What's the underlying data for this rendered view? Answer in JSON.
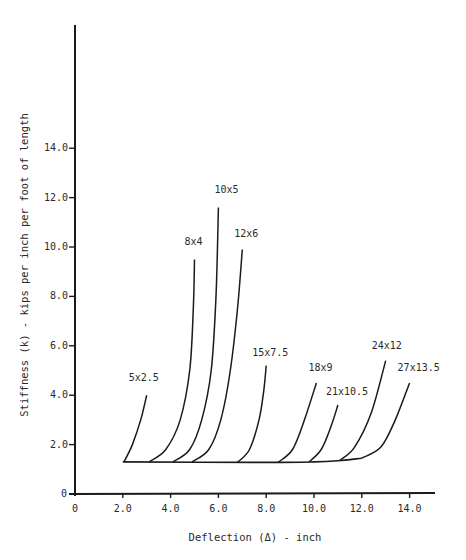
{
  "chart_data": {
    "type": "line",
    "title": "",
    "xlabel": "Deflection (Δ) - inch",
    "ylabel": "Stiffness (k) - kips per inch per foot of length",
    "xlim": [
      0,
      15
    ],
    "ylim": [
      0,
      17.5
    ],
    "x_ticks": [
      "0",
      "2.0",
      "4.0",
      "6.0",
      "8.0",
      "10.0",
      "12.0",
      "14.0"
    ],
    "x_tick_values": [
      0,
      2,
      4,
      6,
      8,
      10,
      12,
      14
    ],
    "y_ticks": [
      "0",
      "2.0",
      "4.0",
      "6.0",
      "8.0",
      "10.0",
      "12.0",
      "14.0"
    ],
    "y_tick_values": [
      0,
      2,
      4,
      6,
      8,
      10,
      12,
      14
    ],
    "grid": false,
    "legend": "inline labels at curve ends",
    "baseline": {
      "description": "common initial stiffness line",
      "points": [
        [
          2.0,
          1.3
        ],
        [
          8.0,
          1.28
        ],
        [
          10.0,
          1.3
        ],
        [
          11.0,
          1.35
        ],
        [
          12.0,
          1.45
        ]
      ]
    },
    "series": [
      {
        "name": "5x2.5",
        "points": [
          [
            2.05,
            1.3
          ],
          [
            2.4,
            2.0
          ],
          [
            2.75,
            3.0
          ],
          [
            3.0,
            4.0
          ]
        ]
      },
      {
        "name": "8x4",
        "points": [
          [
            3.1,
            1.3
          ],
          [
            3.8,
            1.8
          ],
          [
            4.4,
            3.0
          ],
          [
            4.8,
            5.0
          ],
          [
            4.95,
            7.5
          ],
          [
            5.0,
            9.5
          ]
        ]
      },
      {
        "name": "10x5",
        "points": [
          [
            4.1,
            1.3
          ],
          [
            4.8,
            1.8
          ],
          [
            5.3,
            3.0
          ],
          [
            5.7,
            5.0
          ],
          [
            5.9,
            8.0
          ],
          [
            6.0,
            11.6
          ]
        ]
      },
      {
        "name": "12x6",
        "points": [
          [
            4.9,
            1.3
          ],
          [
            5.6,
            1.8
          ],
          [
            6.1,
            3.0
          ],
          [
            6.5,
            5.0
          ],
          [
            6.8,
            7.5
          ],
          [
            7.0,
            9.9
          ]
        ]
      },
      {
        "name": "15x7.5",
        "points": [
          [
            6.8,
            1.28
          ],
          [
            7.3,
            1.8
          ],
          [
            7.7,
            3.0
          ],
          [
            7.9,
            4.2
          ],
          [
            8.0,
            5.2
          ]
        ]
      },
      {
        "name": "18x9",
        "points": [
          [
            8.5,
            1.28
          ],
          [
            9.1,
            1.8
          ],
          [
            9.6,
            3.0
          ],
          [
            10.1,
            4.5
          ]
        ]
      },
      {
        "name": "21x10.5",
        "points": [
          [
            9.8,
            1.3
          ],
          [
            10.3,
            1.8
          ],
          [
            10.7,
            2.7
          ],
          [
            11.0,
            3.6
          ]
        ]
      },
      {
        "name": "24x12",
        "points": [
          [
            11.1,
            1.38
          ],
          [
            11.7,
            1.9
          ],
          [
            12.4,
            3.3
          ],
          [
            13.0,
            5.4
          ]
        ]
      },
      {
        "name": "27x13.5",
        "points": [
          [
            12.0,
            1.45
          ],
          [
            12.8,
            1.9
          ],
          [
            13.4,
            3.0
          ],
          [
            14.0,
            4.5
          ]
        ]
      }
    ]
  }
}
